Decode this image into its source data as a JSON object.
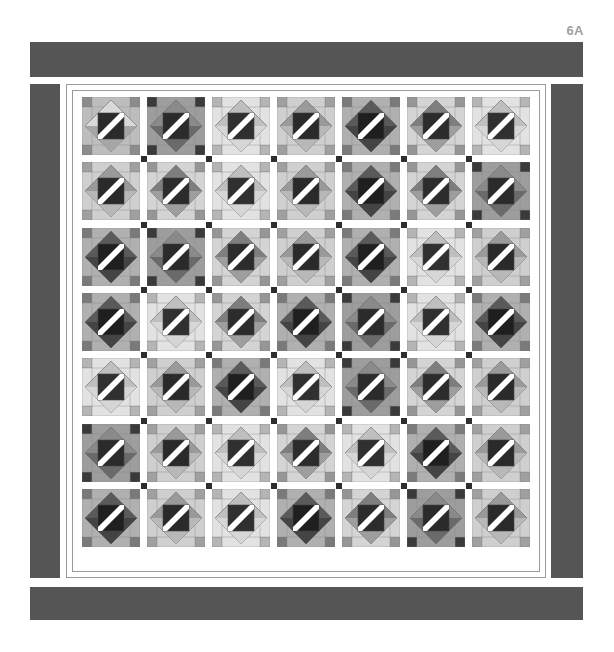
{
  "figure": {
    "label": "6A"
  },
  "colors": {
    "border": "#555555",
    "frame_line": "#9a9a9a",
    "post": "#2e2e2e",
    "white": "#ffffff",
    "light": "#d8d8d8",
    "mid": "#a8a8a8",
    "dark": "#5e5e5e",
    "darkest": "#262626"
  },
  "grid": {
    "rows": 7,
    "cols": 7,
    "pitch_x": 65,
    "pitch_y": 65.3,
    "block_size": 58
  },
  "palettes": [
    {
      "frame": "#bdbdbd",
      "corner": "#8c8c8c",
      "diamond": "#d9d9d9",
      "diamond_alt": "#a6a6a6",
      "center": "#2b2b2b"
    },
    {
      "frame": "#9d9d9d",
      "corner": "#3a3a3a",
      "diamond": "#8a8a8a",
      "diamond_alt": "#6a6a6a",
      "center": "#2b2b2b"
    },
    {
      "frame": "#e2e2e2",
      "corner": "#b5b5b5",
      "diamond": "#bfbfbf",
      "diamond_alt": "#d6d6d6",
      "center": "#303030"
    },
    {
      "frame": "#cfcfcf",
      "corner": "#a0a0a0",
      "diamond": "#9a9a9a",
      "diamond_alt": "#b8b8b8",
      "center": "#2a2a2a"
    },
    {
      "frame": "#b0b0b0",
      "corner": "#7a7a7a",
      "diamond": "#5a5a5a",
      "diamond_alt": "#444444",
      "center": "#1f1f1f"
    },
    {
      "frame": "#d4d4d4",
      "corner": "#969696",
      "diamond": "#7e7e7e",
      "diamond_alt": "#9e9e9e",
      "center": "#2c2c2c"
    }
  ],
  "layout": [
    [
      0,
      1,
      2,
      3,
      4,
      5,
      2
    ],
    [
      3,
      5,
      2,
      3,
      4,
      5,
      1
    ],
    [
      4,
      1,
      5,
      3,
      4,
      2,
      3
    ],
    [
      4,
      2,
      5,
      4,
      1,
      2,
      4
    ],
    [
      2,
      3,
      4,
      2,
      1,
      5,
      3
    ],
    [
      1,
      3,
      2,
      5,
      2,
      4,
      3
    ],
    [
      4,
      3,
      2,
      4,
      5,
      1,
      3
    ]
  ]
}
